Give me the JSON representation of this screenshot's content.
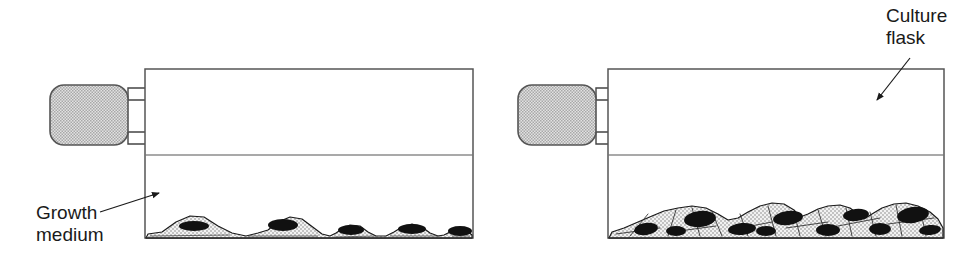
{
  "figure": {
    "title_alt": "Culture flask cell growth diagram",
    "background_color": "#ffffff",
    "line_color": "#444444",
    "cell_outline_color": "#1a1a1a",
    "nucleus_color": "#111111",
    "cytoplasm_fill": "#e8e8e8",
    "cap_fill": "#cccccc"
  },
  "labels": {
    "culture_flask": {
      "line1": "Culture",
      "line2": "flask",
      "x": 886,
      "y": 22
    },
    "growth_medium": {
      "line1": "Growth",
      "line2": "medium",
      "x": 36,
      "y": 219
    }
  },
  "flasks": [
    {
      "name": "subconfluent-flask",
      "position": "left",
      "body": {
        "x": 145,
        "y": 69,
        "width": 328,
        "height": 169
      },
      "medium_line_y": 155,
      "cap": {
        "x": 50,
        "y": 85,
        "width": 78,
        "height": 60,
        "radius": 14
      },
      "neck": {
        "x": 128,
        "y": 88,
        "width": 18,
        "height": 56
      },
      "cell_count": 5,
      "confluence": "subconfluent",
      "cells": [
        {
          "cx": 196,
          "cy": 237,
          "half_width": 34,
          "height": 21,
          "nucleus_rx": 15,
          "nucleus_ry": 5,
          "nucleus_dx": -2,
          "nucleus_dy": -11
        },
        {
          "cx": 283,
          "cy": 237,
          "half_width": 33,
          "height": 22,
          "nucleus_rx": 15,
          "nucleus_ry": 6,
          "nucleus_dx": 0,
          "nucleus_dy": -12
        },
        {
          "cx": 351,
          "cy": 237,
          "half_width": 30,
          "height": 15,
          "nucleus_rx": 13,
          "nucleus_ry": 5,
          "nucleus_dx": 0,
          "nucleus_dy": -7
        },
        {
          "cx": 412,
          "cy": 237,
          "half_width": 30,
          "height": 17,
          "nucleus_rx": 14,
          "nucleus_ry": 5,
          "nucleus_dx": 0,
          "nucleus_dy": -8
        },
        {
          "cx": 460,
          "cy": 237,
          "half_width": 25,
          "height": 14,
          "nucleus_rx": 12,
          "nucleus_ry": 5,
          "nucleus_dx": 0,
          "nucleus_dy": -6
        }
      ]
    },
    {
      "name": "confluent-flask",
      "position": "right",
      "body": {
        "x": 608,
        "y": 69,
        "width": 336,
        "height": 169
      },
      "medium_line_y": 155,
      "cap": {
        "x": 518,
        "y": 85,
        "width": 78,
        "height": 60,
        "radius": 14
      },
      "neck": {
        "x": 596,
        "y": 88,
        "width": 18,
        "height": 56
      },
      "cell_count": 11,
      "confluence": "confluent",
      "cells": [
        {
          "cx": 648,
          "cy": 237,
          "half_width": 30,
          "height": 18,
          "nucleus_rx": 12,
          "nucleus_ry": 6,
          "nucleus_dx": -2,
          "nucleus_dy": -8
        },
        {
          "cx": 700,
          "cy": 237,
          "half_width": 36,
          "height": 31,
          "nucleus_rx": 16,
          "nucleus_ry": 8,
          "nucleus_dx": 0,
          "nucleus_dy": -18
        },
        {
          "cx": 742,
          "cy": 237,
          "half_width": 30,
          "height": 18,
          "nucleus_rx": 14,
          "nucleus_ry": 6,
          "nucleus_dx": 0,
          "nucleus_dy": -8
        },
        {
          "cx": 790,
          "cy": 237,
          "half_width": 33,
          "height": 30,
          "nucleus_rx": 15,
          "nucleus_ry": 7,
          "nucleus_dx": -2,
          "nucleus_dy": -19
        },
        {
          "cx": 828,
          "cy": 237,
          "half_width": 26,
          "height": 16,
          "nucleus_rx": 12,
          "nucleus_ry": 6,
          "nucleus_dx": 0,
          "nucleus_dy": -7
        },
        {
          "cx": 856,
          "cy": 237,
          "half_width": 30,
          "height": 32,
          "nucleus_rx": 13,
          "nucleus_ry": 6,
          "nucleus_dx": 0,
          "nucleus_dy": -22
        },
        {
          "cx": 880,
          "cy": 237,
          "half_width": 24,
          "height": 17,
          "nucleus_rx": 11,
          "nucleus_ry": 6,
          "nucleus_dx": 0,
          "nucleus_dy": -8
        },
        {
          "cx": 915,
          "cy": 237,
          "half_width": 31,
          "height": 33,
          "nucleus_rx": 16,
          "nucleus_ry": 8,
          "nucleus_dx": -2,
          "nucleus_dy": -22
        },
        {
          "cx": 930,
          "cy": 237,
          "half_width": 22,
          "height": 15,
          "nucleus_rx": 11,
          "nucleus_ry": 5,
          "nucleus_dx": 0,
          "nucleus_dy": -7
        },
        {
          "cx": 676,
          "cy": 237,
          "half_width": 24,
          "height": 14,
          "nucleus_rx": 10,
          "nucleus_ry": 5,
          "nucleus_dx": 0,
          "nucleus_dy": -6
        },
        {
          "cx": 766,
          "cy": 237,
          "half_width": 24,
          "height": 14,
          "nucleus_rx": 10,
          "nucleus_ry": 5,
          "nucleus_dx": 0,
          "nucleus_dy": -6
        }
      ]
    }
  ],
  "leader_lines": {
    "culture_flask_arrow": {
      "x1": 910,
      "y1": 58,
      "x2": 877,
      "y2": 103
    },
    "growth_medium_arrow": {
      "x1": 100,
      "y1": 212,
      "x2": 163,
      "y2": 192
    }
  }
}
